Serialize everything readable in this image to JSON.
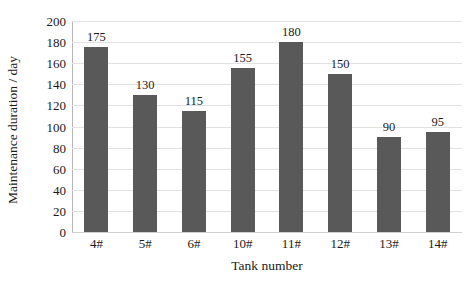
{
  "chart_data": {
    "type": "bar",
    "title": "",
    "subtitle": "",
    "xlabel": "Tank number",
    "ylabel": "Maintenance duration / day",
    "categories": [
      "4#",
      "5#",
      "6#",
      "10#",
      "11#",
      "12#",
      "13#",
      "14#"
    ],
    "values": [
      175,
      130,
      115,
      155,
      180,
      150,
      90,
      95
    ],
    "data_labels": [
      "175",
      "130",
      "115",
      "155",
      "180",
      "150",
      "90",
      "95"
    ],
    "ylim": [
      0,
      200
    ],
    "ytick_values": [
      0,
      20,
      40,
      60,
      80,
      100,
      120,
      140,
      160,
      180,
      200
    ],
    "ytick_labels": [
      "0",
      "20",
      "40",
      "60",
      "80",
      "100",
      "120",
      "140",
      "160",
      "180",
      "200"
    ],
    "grid": "horizontal",
    "legend": "none",
    "series": [
      {
        "name": "Maintenance duration",
        "values": [
          175,
          130,
          115,
          155,
          180,
          150,
          90,
          95
        ]
      }
    ],
    "colors": {
      "bar": "#595959",
      "gridline": "#e2e2e2",
      "axis": "#b5b5b5",
      "text": "#1a1a1a",
      "background": "#ffffff"
    }
  }
}
